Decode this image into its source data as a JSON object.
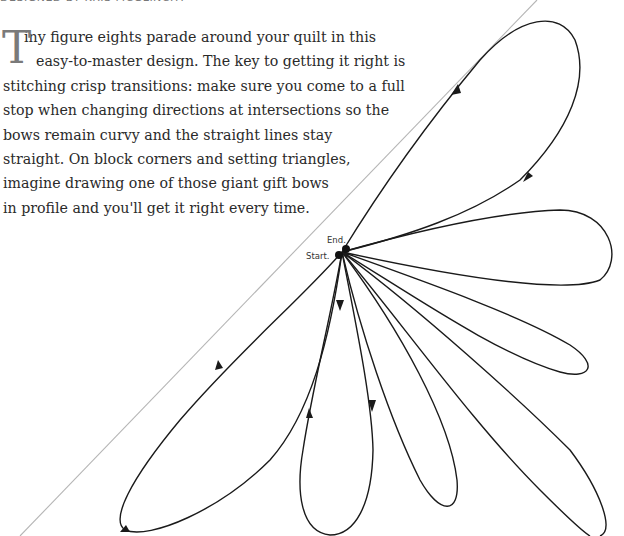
{
  "byline": "Designed by Kris McGlinchy",
  "intro": {
    "drop_cap": "T",
    "lines": [
      "iny figure eights parade around your quilt in this",
      "easy-to-master design. The key to getting it right is",
      "stitching crisp transitions: make sure you come to a full",
      "stop when changing directions at intersections so the",
      "bows remain curvy and the straight lines stay",
      "straight. On block corners and setting triangles,",
      "imagine drawing one of those giant gift bows",
      "in profile and you'll get it right every time."
    ]
  },
  "diagram": {
    "start_label": "Start.",
    "end_label": "End.",
    "line_color": "#1a1a1a",
    "guide_color": "#b5b5b5",
    "loops": 7,
    "direction_arrows": 6
  }
}
